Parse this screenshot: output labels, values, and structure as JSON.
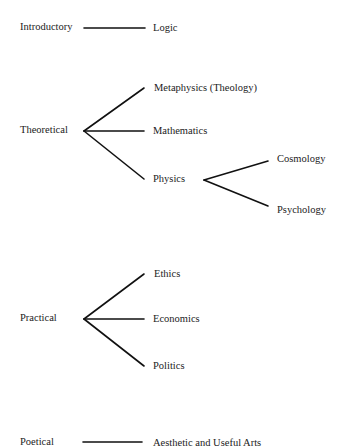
{
  "diagram": {
    "branches": [
      {
        "name": "Introductory",
        "children": [
          "Logic"
        ]
      },
      {
        "name": "Theoretical",
        "children": [
          "Metaphysics (Theology)",
          "Mathematics",
          "Physics"
        ]
      },
      {
        "name": "Physics",
        "children": [
          "Cosmology",
          "Psychology"
        ]
      },
      {
        "name": "Practical",
        "children": [
          "Ethics",
          "Economics",
          "Politics"
        ]
      },
      {
        "name": "Poetical",
        "children": [
          "Aesthetic and Useful Arts"
        ]
      }
    ]
  },
  "labels": {
    "introductory": "Introductory",
    "logic": "Logic",
    "theoretical": "Theoretical",
    "metaphysics": "Metaphysics (Theology)",
    "mathematics": "Mathematics",
    "physics": "Physics",
    "cosmology": "Cosmology",
    "psychology": "Psychology",
    "practical": "Practical",
    "ethics": "Ethics",
    "economics": "Economics",
    "politics": "Politics",
    "poetical": "Poetical",
    "arts": "Aesthetic and Useful Arts"
  },
  "colors": {
    "background": "#ffffff",
    "text": "#222222",
    "lines": "#111111"
  }
}
